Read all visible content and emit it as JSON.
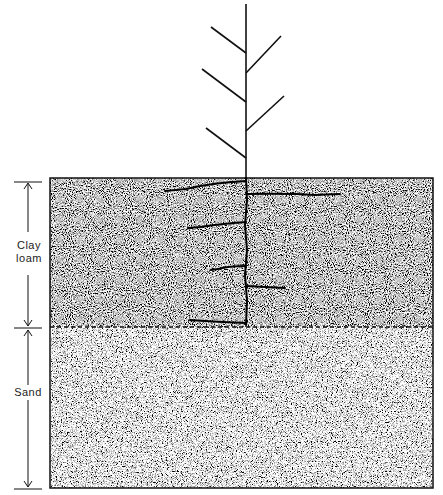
{
  "diagram": {
    "type": "soil-profile-with-plant",
    "layers": [
      {
        "name": "clay-loam",
        "label_line1": "Clay",
        "label_line2": "loam",
        "top": 178,
        "bottom": 327,
        "texture": "coarse-dense-stipple",
        "color": "#8a8a8a"
      },
      {
        "name": "sand",
        "label": "Sand",
        "top": 327,
        "bottom": 488,
        "texture": "fine-stipple",
        "color": "#d8d8d8"
      }
    ],
    "boundary_style": "dashed",
    "plant": {
      "stem_x": 246,
      "stem_top": 4,
      "branches": [
        {
          "side": "left",
          "from": [
            246,
            53
          ],
          "to": [
            211,
            27
          ]
        },
        {
          "side": "right",
          "from": [
            246,
            73
          ],
          "to": [
            281,
            36
          ]
        },
        {
          "side": "left",
          "from": [
            246,
            102
          ],
          "to": [
            202,
            69
          ]
        },
        {
          "side": "right",
          "from": [
            246,
            131
          ],
          "to": [
            284,
            96
          ]
        },
        {
          "side": "left",
          "from": [
            246,
            158
          ],
          "to": [
            206,
            128
          ]
        }
      ],
      "root_bottom": 325,
      "lateral_roots": [
        {
          "side": "left",
          "from": [
            246,
            181
          ],
          "to": [
            165,
            190
          ]
        },
        {
          "side": "right",
          "from": [
            246,
            194
          ],
          "to": [
            340,
            195
          ]
        },
        {
          "side": "left",
          "from": [
            246,
            222
          ],
          "to": [
            188,
            228
          ]
        },
        {
          "side": "left",
          "from": [
            246,
            266
          ],
          "to": [
            211,
            270
          ]
        },
        {
          "side": "right",
          "from": [
            246,
            286
          ],
          "to": [
            285,
            288
          ]
        },
        {
          "side": "left",
          "from": [
            246,
            323
          ],
          "to": [
            190,
            320
          ]
        }
      ]
    }
  }
}
